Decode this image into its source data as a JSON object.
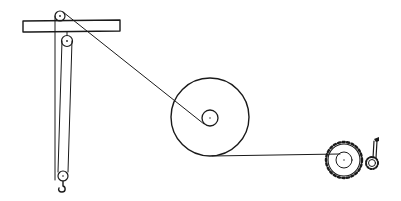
{
  "diagram": {
    "description": "Pulley and winch system: fixed beam with pulleys, movable pulley with hook, rope to wheel-and-axle, rope to geared crank windlass",
    "colors": {
      "ink": "#1a1a1a",
      "background": "#ffffff"
    },
    "components": [
      {
        "id": "beam",
        "label": "fixed beam"
      },
      {
        "id": "top-pulley",
        "label": "fixed pulley on beam"
      },
      {
        "id": "lower-fixed-pulley",
        "label": "fixed pulley under beam"
      },
      {
        "id": "movable-pulley",
        "label": "movable pulley with hook"
      },
      {
        "id": "wheel-and-axle",
        "label": "large wheel with small axle"
      },
      {
        "id": "gear-wheel",
        "label": "toothed gear wheel"
      },
      {
        "id": "pinion-crank",
        "label": "pinion with crank handle"
      }
    ],
    "connections": [
      {
        "from": "top-pulley",
        "to": "wheel-and-axle",
        "via": "rope to axle"
      },
      {
        "from": "wheel-and-axle",
        "to": "gear-wheel",
        "via": "rope from wheel rim"
      },
      {
        "from": "gear-wheel",
        "to": "pinion-crank",
        "via": "meshed teeth"
      }
    ]
  }
}
